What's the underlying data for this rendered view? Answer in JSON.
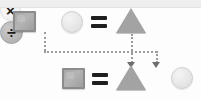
{
  "diagram": {
    "title": "Shape equation rearrangement",
    "background_color": "#fdfdfd",
    "accent_color": "#9a9a9a",
    "equations": [
      {
        "id": "top-equation",
        "expression": "square x circle = triangle",
        "terms": [
          {
            "name": "square",
            "label": "square",
            "color": "#a8a8a8"
          },
          {
            "name": "multiply",
            "label": "×",
            "color": "#1b1b1b"
          },
          {
            "name": "circle",
            "label": "circle",
            "color": "#e6e6e6"
          },
          {
            "name": "equals",
            "label": "=",
            "color": "#1f1f1f"
          },
          {
            "name": "triangle",
            "label": "triangle",
            "color": "#a3a3a3"
          }
        ]
      },
      {
        "id": "bottom-equation",
        "expression": "square = triangle ÷ circle",
        "terms": [
          {
            "name": "square",
            "label": "square",
            "color": "#a8a8a8"
          },
          {
            "name": "equals",
            "label": "=",
            "color": "#1f1f1f"
          },
          {
            "name": "triangle",
            "label": "triangle",
            "color": "#a3a3a3"
          },
          {
            "name": "divide",
            "label": "÷",
            "color": "#1b1b1b"
          },
          {
            "name": "circle",
            "label": "circle",
            "color": "#e6e6e6"
          }
        ]
      }
    ],
    "connectors": [
      {
        "id": "times-to-divide",
        "from": "multiply",
        "to": "divide",
        "style": "dotted",
        "arrow": true
      },
      {
        "id": "triangle-down",
        "from": "triangle",
        "to": "triangle",
        "style": "dotted",
        "arrow": true
      }
    ],
    "operators": {
      "multiply_glyph": "×",
      "divide_glyph": "÷",
      "equals_glyph": "="
    }
  }
}
